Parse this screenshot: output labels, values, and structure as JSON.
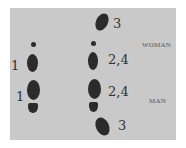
{
  "diagram": {
    "type": "dance footwork diagram",
    "background_color": "#c9c9c9",
    "footprint_color": "#2b2b2b",
    "left_column": {
      "steps": [
        {
          "label": "1",
          "foot": "woman"
        },
        {
          "label": "1",
          "foot": "man"
        }
      ]
    },
    "right_column": {
      "steps": [
        {
          "label": "3",
          "foot": "woman"
        },
        {
          "label": "2,4",
          "foot": "woman"
        },
        {
          "label": "2,4",
          "foot": "man"
        },
        {
          "label": "3",
          "foot": "man"
        }
      ]
    },
    "role_labels": {
      "woman": "WOMAN",
      "man": "MAN"
    }
  }
}
